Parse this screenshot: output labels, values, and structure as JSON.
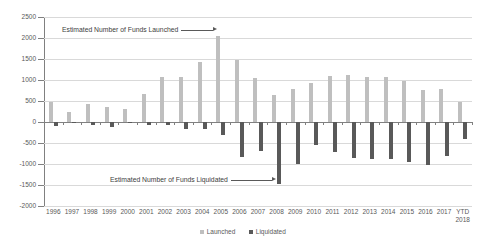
{
  "chart_data": {
    "type": "bar",
    "title": "",
    "xlabel": "",
    "ylabel": "",
    "ylim": [
      -2000,
      2500
    ],
    "ytick_step": 500,
    "grid": true,
    "legend_position": "bottom",
    "categories": [
      "1996",
      "1997",
      "1998",
      "1999",
      "2000",
      "2001",
      "2002",
      "2003",
      "2004",
      "2005",
      "2006",
      "2007",
      "2008",
      "2009",
      "2010",
      "2011",
      "2012",
      "2013",
      "2014",
      "2015",
      "2016",
      "2017",
      "YTD 2018"
    ],
    "yticks": [
      "2500",
      "2000",
      "1500",
      "1000",
      "500",
      "0",
      "-500",
      "-1000",
      "-1500",
      "-2000"
    ],
    "series": [
      {
        "name": "Launched",
        "color": "#bfbfbf",
        "values": [
          480,
          230,
          430,
          350,
          320,
          660,
          1060,
          1060,
          1420,
          2050,
          1480,
          1040,
          650,
          780,
          930,
          1100,
          1110,
          1060,
          1070,
          970,
          770,
          790,
          470
        ]
      },
      {
        "name": "Liquidated",
        "color": "#595959",
        "values": [
          -90,
          -30,
          -60,
          -110,
          -30,
          -60,
          -80,
          -160,
          -170,
          -310,
          -830,
          -700,
          -1470,
          -1010,
          -550,
          -720,
          -850,
          -880,
          -880,
          -960,
          -1030,
          -800,
          -400
        ]
      }
    ],
    "annotations": [
      {
        "text": "Estimated Number of Funds Launched",
        "target_category": "2005",
        "target_series": "Launched"
      },
      {
        "text": "Estimated Number of Funds Liquidated",
        "target_category": "2008",
        "target_series": "Liquidated"
      }
    ]
  },
  "legend": {
    "items": [
      {
        "label": "Launched"
      },
      {
        "label": "Liquidated"
      }
    ]
  }
}
